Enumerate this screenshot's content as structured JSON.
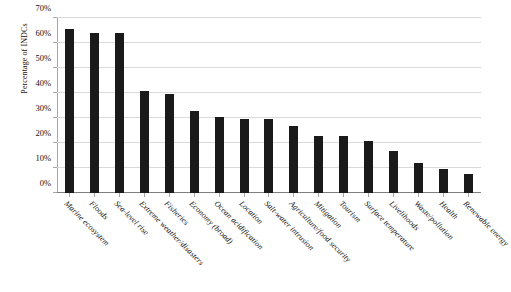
{
  "chart_data": {
    "type": "bar",
    "title": "",
    "xlabel": "",
    "ylabel": "Percentage of INDCs",
    "ylim": [
      0,
      70
    ],
    "ytick_labels": [
      "0%",
      "10%",
      "20%",
      "30%",
      "40%",
      "50%",
      "60%",
      "70%"
    ],
    "ytick_values": [
      0,
      10,
      20,
      30,
      40,
      50,
      60,
      70
    ],
    "grid": true,
    "legend": "none",
    "bar_color": "#1a1a1a",
    "categories": [
      "Marine ecosystem",
      "Floods",
      "Sea-level rise",
      "Extreme weather/disasters",
      "Fisheries",
      "Economy (broad)",
      "Ocean acidification",
      "Location",
      "Salt-water intrusion",
      "Agriculture/food security",
      "Mitigation",
      "Tourism",
      "Surface temperature",
      "Livelihoods",
      "Waste/pollution",
      "Health",
      "Renewable energy"
    ],
    "values": [
      65.5,
      64,
      64,
      41,
      39.5,
      33,
      30.5,
      29.5,
      29.5,
      27,
      23,
      23,
      21,
      17,
      12,
      9.5,
      7.5
    ]
  }
}
